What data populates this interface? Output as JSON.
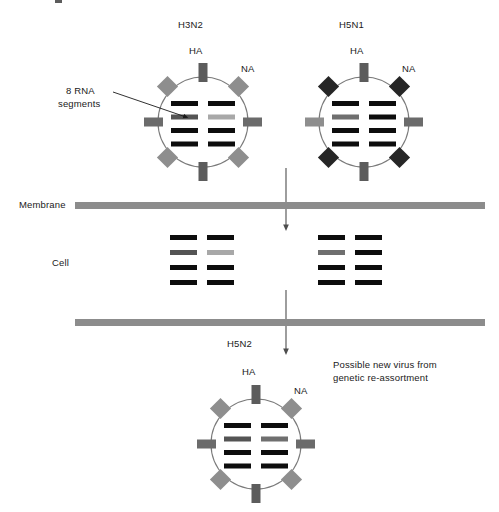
{
  "diagram": {
    "title_hidden_fragment": "",
    "labels": {
      "virus_left": "H3N2",
      "virus_right": "H5N1",
      "virus_bottom": "H5N2",
      "ha_left": "HA",
      "na_left": "NA",
      "ha_right": "HA",
      "na_right": "NA",
      "ha_bottom": "HA",
      "na_bottom": "NA",
      "rna_callout_line1": "8 RNA",
      "rna_callout_line2": "segments",
      "membrane": "Membrane",
      "cell": "Cell",
      "outcome_line1": "Possible new virus from",
      "outcome_line2": "genetic re-assortment"
    },
    "colors": {
      "envelope_stroke": "#7a7a7a",
      "ha_spike": "#5c5c5c",
      "na_spike_gray": "#8e8e8e",
      "na_spike_dark": "#262626",
      "rna_black": "#0d0d0d",
      "rna_dark_gray": "#545454",
      "rna_mid_gray": "#6f6f6f",
      "rna_light_gray": "#a8a8a8",
      "membrane": "#8c8c8c",
      "arrow": "#4d4d4d",
      "text": "#1a1a1a"
    },
    "viruses": [
      {
        "name": "H3N2",
        "cx": 203,
        "cy": 122,
        "r": 45,
        "na_color_key": "na_spike_gray",
        "rna_rows": [
          [
            "rna_black",
            "rna_black"
          ],
          [
            "rna_dark_gray",
            "rna_light_gray"
          ],
          [
            "rna_black",
            "rna_black"
          ],
          [
            "rna_black",
            "rna_black"
          ]
        ]
      },
      {
        "name": "H5N1",
        "cx": 364,
        "cy": 122,
        "r": 45,
        "na_color_key": "na_spike_dark",
        "rna_rows": [
          [
            "rna_black",
            "rna_black"
          ],
          [
            "rna_mid_gray",
            "rna_black"
          ],
          [
            "rna_black",
            "rna_black"
          ],
          [
            "rna_black",
            "rna_black"
          ]
        ]
      },
      {
        "name": "H5N2",
        "cx": 256,
        "cy": 444,
        "r": 45,
        "na_color_key": "na_spike_gray",
        "rna_rows": [
          [
            "rna_black",
            "rna_black"
          ],
          [
            "rna_dark_gray",
            "rna_mid_gray"
          ],
          [
            "rna_black",
            "rna_black"
          ],
          [
            "rna_black",
            "rna_black"
          ]
        ]
      }
    ],
    "cell_rna_groups": [
      {
        "id": "left",
        "x": 170,
        "y": 235,
        "rows": [
          [
            "rna_black",
            "rna_black"
          ],
          [
            "rna_dark_gray",
            "rna_light_gray"
          ],
          [
            "rna_black",
            "rna_black"
          ],
          [
            "rna_black",
            "rna_black"
          ]
        ]
      },
      {
        "id": "right",
        "x": 318,
        "y": 235,
        "rows": [
          [
            "rna_black",
            "rna_black"
          ],
          [
            "rna_mid_gray",
            "rna_black"
          ],
          [
            "rna_black",
            "rna_black"
          ],
          [
            "rna_black",
            "rna_black"
          ]
        ]
      }
    ],
    "membranes": [
      {
        "id": "upper",
        "x": 75,
        "y": 202,
        "width": 410,
        "height": 7
      },
      {
        "id": "lower",
        "x": 75,
        "y": 319,
        "width": 410,
        "height": 7
      }
    ],
    "arrows": [
      {
        "id": "entry",
        "x1": 286,
        "y1": 168,
        "x2": 286,
        "y2": 228
      },
      {
        "id": "exit",
        "x1": 286,
        "y1": 290,
        "x2": 286,
        "y2": 352
      }
    ],
    "callout_arrow": {
      "x1": 113,
      "y1": 92,
      "x2": 186,
      "y2": 117
    }
  }
}
